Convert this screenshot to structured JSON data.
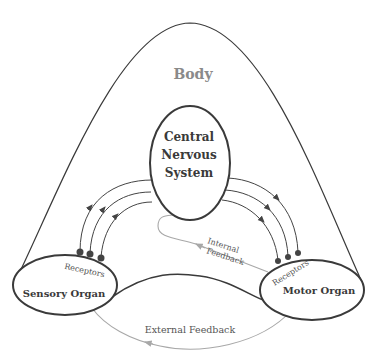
{
  "diagram": {
    "body_label": "Body",
    "cns_label": [
      "Central",
      "Nervous",
      "System"
    ],
    "sensory_label": "Sensory Organ",
    "motor_label": "Motor Organ",
    "sensory_receptors_label": "Receptors",
    "motor_receptors_label": "Receptors",
    "internal_feedback_label": [
      "Internal",
      "Feedback"
    ],
    "external_feedback_label": "External Feedback",
    "colors": {
      "outline": "#3a3a3a",
      "text_dark": "#3a3a3a",
      "text_light": "#8a8a8a",
      "feedback": "#a8a8a8"
    }
  }
}
